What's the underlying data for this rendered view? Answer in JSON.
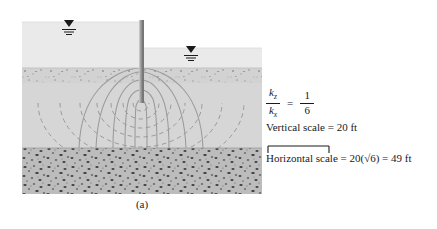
{
  "figure": {
    "caption": "(a)",
    "cross_section": {
      "sheet_pile": "sheet-pile-wall",
      "left_water_symbol": "water-table-triangle",
      "right_water_symbol": "water-table-triangle",
      "layers": [
        {
          "name": "upstream-water",
          "label": "water"
        },
        {
          "name": "downstream-water",
          "label": "water"
        },
        {
          "name": "permeable-soil",
          "label": "soil"
        },
        {
          "name": "impervious-rock",
          "label": "rock"
        }
      ],
      "flow_net": {
        "flow_lines": "dashed",
        "equipotential_lines": "solid"
      }
    }
  },
  "annotations": {
    "ratio": {
      "numerator_symbol": "k",
      "numerator_subscript": "z",
      "denominator_symbol": "k",
      "denominator_subscript": "x",
      "equals": "=",
      "value_numerator": "1",
      "value_denominator": "6"
    },
    "vertical_scale": "Vertical scale = 20 ft",
    "horizontal_scale": "Horizontal scale = 20(√6) = 49 ft",
    "scale_bar": "scale-bar"
  },
  "colors": {
    "water": "#e9e9e9",
    "soil": "#d6d6d6",
    "soil_top_band": "#cbcbcb",
    "rock": "#b9b9b9",
    "pile": "#8e8e8e",
    "flow_line": "#8c8c8c",
    "text": "#1a1a1a",
    "page_background": "#ffffff"
  }
}
